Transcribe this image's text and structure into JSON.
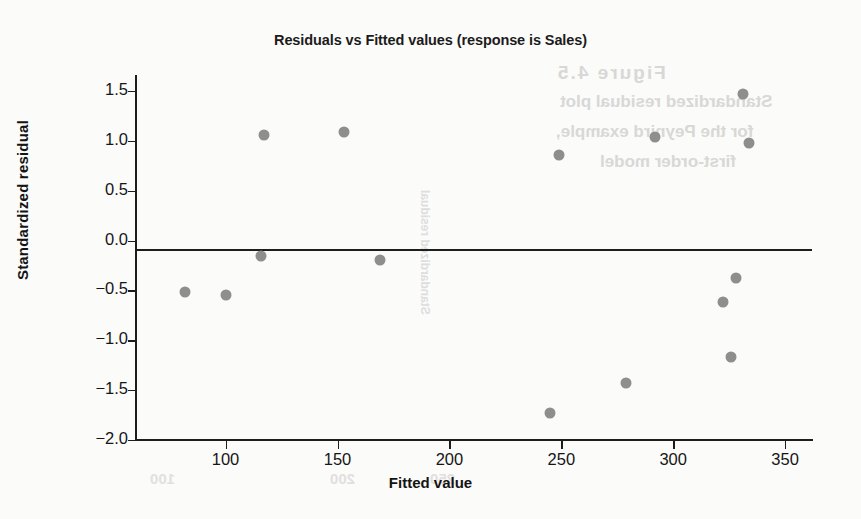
{
  "chart_data": {
    "type": "scatter",
    "title": "Residuals vs Fitted values (response is Sales)",
    "xlabel": "Fitted value",
    "ylabel": "Standardized residual",
    "xlim": [
      60,
      362
    ],
    "ylim": [
      -2.0,
      1.65
    ],
    "xticks": [
      "100",
      "150",
      "200",
      "250",
      "300",
      "350"
    ],
    "xtick_values": [
      100,
      150,
      200,
      250,
      300,
      350
    ],
    "yticks": [
      "1.5",
      "1.0",
      "0.5",
      "0.0",
      "−0.5",
      "−1.0",
      "−1.5",
      "−2.0"
    ],
    "ytick_values": [
      1.5,
      1.0,
      0.5,
      0.0,
      -0.5,
      -1.0,
      -1.5,
      -2.0
    ],
    "grid": false,
    "legend": false,
    "reference_line": {
      "y": 0.0,
      "style": "solid",
      "color": "#1d1d1d"
    },
    "marker_color": "#8e8e8e",
    "points": [
      {
        "x": 82,
        "y": -0.52
      },
      {
        "x": 100,
        "y": -0.55
      },
      {
        "x": 116,
        "y": -0.15
      },
      {
        "x": 117,
        "y": 1.06
      },
      {
        "x": 153,
        "y": 1.09
      },
      {
        "x": 169,
        "y": -0.19
      },
      {
        "x": 245,
        "y": -1.73
      },
      {
        "x": 249,
        "y": 0.86
      },
      {
        "x": 279,
        "y": -1.43
      },
      {
        "x": 292,
        "y": 1.04
      },
      {
        "x": 322,
        "y": -0.62
      },
      {
        "x": 326,
        "y": -1.17
      },
      {
        "x": 328,
        "y": -0.38
      },
      {
        "x": 331,
        "y": 1.47
      },
      {
        "x": 334,
        "y": 0.98
      }
    ]
  },
  "bleed_text": {
    "line0": "Figure 4.5",
    "line1": "Standardized residual plot",
    "line2": "for the Peynird example,",
    "line3": "first-order model",
    "vertical": "Standardized residual",
    "n100": "100",
    "n200": "200",
    "n250": "250"
  }
}
